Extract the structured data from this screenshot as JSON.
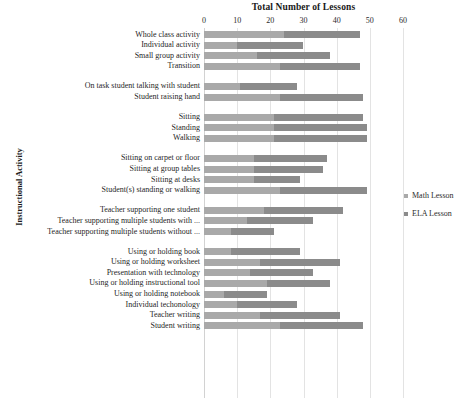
{
  "chart_data": {
    "type": "bar",
    "orientation": "horizontal",
    "stacked": true,
    "title": "Total Number of Lessons",
    "xlabel": "",
    "ylabel": "Instructional Activity",
    "xlim": [
      0,
      60
    ],
    "xticks": [
      0,
      10,
      20,
      30,
      40,
      50,
      60
    ],
    "grid": true,
    "legend_position": "right",
    "legend": [
      "Math Lesson",
      "ELA Lesson"
    ],
    "colors": {
      "math": "#a9a9a9",
      "ela": "#8b8b8b"
    },
    "categories": [
      "Whole class activity",
      "Individual activity",
      "Small group activity",
      "Transition",
      "On task student talking with student",
      "Student raising hand",
      "Sitting",
      "Standing",
      "Walking",
      "Sitting on carpet or floor",
      "Sitting at group tables",
      "Sitting at desks",
      "Student(s) standing or walking",
      "Teacher supporting one student",
      "Teacher supporting multiple students with ...",
      "Teacher supporting multiple students without ...",
      "Using or holding book",
      "Using or holding worksheet",
      "Presentation with technology",
      "Using or holding instructional tool",
      "Using or holding notebook",
      "Individual techonology",
      "Teacher writing",
      "Student writing"
    ],
    "group_breaks_after": [
      3,
      5,
      8,
      12,
      15
    ],
    "series": [
      {
        "name": "Math Lesson",
        "values": [
          24,
          10,
          16,
          23,
          11,
          23,
          21,
          21,
          21,
          15,
          15,
          15,
          23,
          18,
          13,
          8,
          8,
          17,
          14,
          19,
          6,
          10,
          17,
          23
        ]
      },
      {
        "name": "ELA Lesson",
        "values": [
          23,
          20,
          22,
          24,
          17,
          25,
          27,
          28,
          28,
          22,
          21,
          14,
          26,
          24,
          20,
          13,
          21,
          24,
          19,
          19,
          13,
          18,
          24,
          25
        ]
      }
    ],
    "totals": [
      47,
      30,
      38,
      47,
      28,
      48,
      48,
      49,
      49,
      37,
      36,
      29,
      49,
      42,
      33,
      21,
      29,
      41,
      33,
      38,
      19,
      28,
      41,
      48
    ]
  }
}
